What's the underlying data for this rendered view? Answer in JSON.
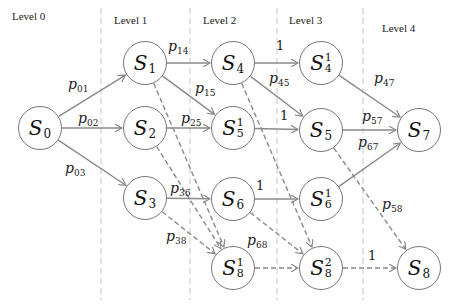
{
  "levels": [
    {
      "label": "Level 0",
      "x": 12,
      "y": 10
    },
    {
      "label": "Level 1",
      "x": 114,
      "y": 14
    },
    {
      "label": "Level 2",
      "x": 203,
      "y": 14
    },
    {
      "label": "Level 3",
      "x": 289,
      "y": 14
    },
    {
      "label": "Level 4",
      "x": 382,
      "y": 22
    }
  ],
  "dividers": [
    101,
    190,
    277,
    363
  ],
  "nodes": [
    {
      "id": "S0",
      "base": "S",
      "sub": "0",
      "sup": "",
      "x": 40,
      "y": 128
    },
    {
      "id": "S1",
      "base": "S",
      "sub": "1",
      "sup": "",
      "x": 145,
      "y": 63
    },
    {
      "id": "S2",
      "base": "S",
      "sub": "2",
      "sup": "",
      "x": 145,
      "y": 128
    },
    {
      "id": "S3",
      "base": "S",
      "sub": "3",
      "sup": "",
      "x": 145,
      "y": 198
    },
    {
      "id": "S4",
      "base": "S",
      "sub": "4",
      "sup": "",
      "x": 233,
      "y": 63
    },
    {
      "id": "S5_1",
      "base": "S",
      "sub": "5",
      "sup": "1",
      "x": 233,
      "y": 128
    },
    {
      "id": "S6",
      "base": "S",
      "sub": "6",
      "sup": "",
      "x": 233,
      "y": 199
    },
    {
      "id": "S8_1",
      "base": "S",
      "sub": "8",
      "sup": "1",
      "x": 233,
      "y": 268
    },
    {
      "id": "S4_1",
      "base": "S",
      "sub": "4",
      "sup": "1",
      "x": 321,
      "y": 63
    },
    {
      "id": "S5",
      "base": "S",
      "sub": "5",
      "sup": "",
      "x": 321,
      "y": 130
    },
    {
      "id": "S6_1",
      "base": "S",
      "sub": "6",
      "sup": "1",
      "x": 321,
      "y": 199
    },
    {
      "id": "S8_2",
      "base": "S",
      "sub": "8",
      "sup": "2",
      "x": 321,
      "y": 268
    },
    {
      "id": "S7",
      "base": "S",
      "sub": "7",
      "sup": "",
      "x": 419,
      "y": 130
    },
    {
      "id": "S8",
      "base": "S",
      "sub": "8",
      "sup": "",
      "x": 419,
      "y": 268
    }
  ],
  "edges": [
    {
      "from": "S0",
      "to": "S1",
      "style": "solid"
    },
    {
      "from": "S0",
      "to": "S2",
      "style": "solid"
    },
    {
      "from": "S0",
      "to": "S3",
      "style": "solid"
    },
    {
      "from": "S1",
      "to": "S4",
      "style": "solid"
    },
    {
      "from": "S1",
      "to": "S5_1",
      "style": "solid"
    },
    {
      "from": "S2",
      "to": "S5_1",
      "style": "solid"
    },
    {
      "from": "S3",
      "to": "S6",
      "style": "solid"
    },
    {
      "from": "S4",
      "to": "S4_1",
      "style": "solid"
    },
    {
      "from": "S4",
      "to": "S5",
      "style": "solid"
    },
    {
      "from": "S5_1",
      "to": "S5",
      "style": "solid"
    },
    {
      "from": "S6",
      "to": "S6_1",
      "style": "solid"
    },
    {
      "from": "S4_1",
      "to": "S7",
      "style": "solid"
    },
    {
      "from": "S5",
      "to": "S7",
      "style": "solid"
    },
    {
      "from": "S6_1",
      "to": "S7",
      "style": "solid"
    },
    {
      "from": "S1",
      "to": "S8_1",
      "style": "dashed"
    },
    {
      "from": "S2",
      "to": "S8_1",
      "style": "dashed"
    },
    {
      "from": "S3",
      "to": "S8_1",
      "style": "dashed"
    },
    {
      "from": "S4",
      "to": "S8_2",
      "style": "dashed"
    },
    {
      "from": "S6",
      "to": "S8_2",
      "style": "dashed"
    },
    {
      "from": "S8_1",
      "to": "S8_2",
      "style": "dashed"
    },
    {
      "from": "S8_2",
      "to": "S8",
      "style": "dashed"
    },
    {
      "from": "S5",
      "to": "S8",
      "style": "dashed"
    }
  ],
  "edge_labels": [
    {
      "p": "p",
      "sub": "01",
      "x": 68,
      "y": 76
    },
    {
      "p": "p",
      "sub": "02",
      "x": 78,
      "y": 110
    },
    {
      "p": "p",
      "sub": "03",
      "x": 65,
      "y": 160
    },
    {
      "p": "p",
      "sub": "14",
      "x": 168,
      "y": 38
    },
    {
      "p": "p",
      "sub": "15",
      "x": 195,
      "y": 80
    },
    {
      "p": "p",
      "sub": "25",
      "x": 181,
      "y": 110
    },
    {
      "p": "p",
      "sub": "36",
      "x": 170,
      "y": 180
    },
    {
      "p": "p",
      "sub": "38",
      "x": 166,
      "y": 228
    },
    {
      "p": "p",
      "sub": "45",
      "x": 269,
      "y": 70
    },
    {
      "p": "p",
      "sub": "47",
      "x": 374,
      "y": 70
    },
    {
      "p": "p",
      "sub": "57",
      "x": 362,
      "y": 108
    },
    {
      "p": "p",
      "sub": "67",
      "x": 358,
      "y": 134
    },
    {
      "p": "p",
      "sub": "58",
      "x": 382,
      "y": 196
    },
    {
      "p": "p",
      "sub": "68",
      "x": 247,
      "y": 232
    }
  ],
  "unit_labels": [
    {
      "text": "1",
      "x": 276,
      "y": 38
    },
    {
      "text": "1",
      "x": 280,
      "y": 108
    },
    {
      "text": "1",
      "x": 256,
      "y": 178
    },
    {
      "text": "1",
      "x": 368,
      "y": 248
    }
  ],
  "colors": {
    "edge": "#8a8a8a",
    "node_border": "#777777",
    "divider": "#d0d0d0"
  }
}
